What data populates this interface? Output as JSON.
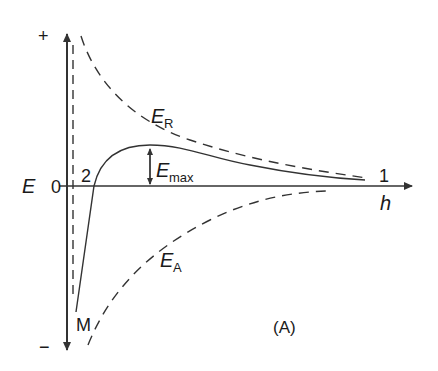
{
  "figure": {
    "panel_label": "(A)",
    "y_axis": {
      "label": "E",
      "plus": "+",
      "minus": "−",
      "zero": "0"
    },
    "x_axis": {
      "label": "h"
    },
    "curves": {
      "repulsion": {
        "label_main": "E",
        "label_sub": "R",
        "style": "dashed"
      },
      "attraction": {
        "label_main": "E",
        "label_sub": "A",
        "style": "dashed"
      },
      "total": {
        "style": "solid"
      }
    },
    "barrier": {
      "label_main": "E",
      "label_sub": "max"
    },
    "points": {
      "primary_min": "M",
      "secondary_min": "2",
      "far_point": "1"
    },
    "colors": {
      "line": "#333333",
      "background": "#ffffff"
    }
  }
}
